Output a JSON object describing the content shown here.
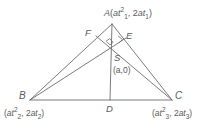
{
  "figure": {
    "kind": "geometry-diagram",
    "background_color": "#ffffff",
    "line_color": "#6b6b6b",
    "text_color": "#5a5a5a"
  },
  "vertices": {
    "A": {
      "letter": "A",
      "coord_open": "(",
      "coord_x_base": "at",
      "coord_x_sub": "1",
      "coord_x_sup": "2",
      "coord_sep": ", 2",
      "coord_y_base": "at",
      "coord_y_sub": "1",
      "coord_close": ")",
      "x": 112,
      "y": 24
    },
    "B": {
      "letter": "B",
      "coord_open": "(",
      "coord_x_base": "at",
      "coord_x_sub": "2",
      "coord_x_sup": "2",
      "coord_sep": ", 2",
      "coord_y_base": "at",
      "coord_y_sub": "2",
      "coord_close": ")",
      "x": 30,
      "y": 100
    },
    "C": {
      "letter": "C",
      "coord_open": "(",
      "coord_x_base": "at",
      "coord_x_sub": "3",
      "coord_x_sup": "2",
      "coord_sep": ", 2",
      "coord_y_base": "at",
      "coord_y_sub": "3",
      "coord_close": ")",
      "x": 172,
      "y": 100
    }
  },
  "points": {
    "D": {
      "letter": "D",
      "x": 110,
      "y": 100
    },
    "E": {
      "letter": "E",
      "x": 124,
      "y": 40
    },
    "F": {
      "letter": "F",
      "x": 95,
      "y": 36
    },
    "S": {
      "letter": "S",
      "coord": "(a,0)",
      "x": 110,
      "y": 62
    },
    "orthocenter": {
      "x": 110,
      "y": 45
    }
  },
  "segments": [
    {
      "name": "side-AB",
      "from": "A",
      "to": "B"
    },
    {
      "name": "side-BC",
      "from": "B",
      "to": "C"
    },
    {
      "name": "side-CA",
      "from": "C",
      "to": "A"
    },
    {
      "name": "altitude-AD",
      "from": "A",
      "to": "D"
    },
    {
      "name": "altitude-BE",
      "from": "B",
      "to": "E"
    },
    {
      "name": "altitude-CF",
      "from": "C",
      "to": "F"
    }
  ],
  "right_angle_marks": [
    {
      "name": "right-angle-at-E",
      "x": 120,
      "y": 40
    },
    {
      "name": "right-angle-at-orthocenter",
      "x": 110,
      "y": 44
    }
  ]
}
